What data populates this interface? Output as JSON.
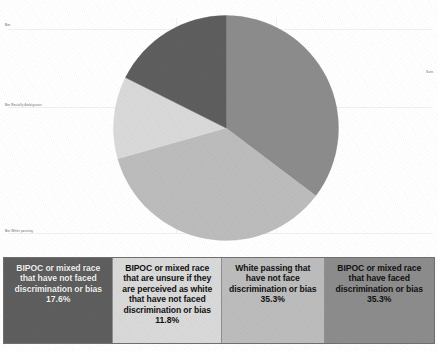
{
  "chart_data": {
    "type": "pie",
    "title": "",
    "subtitle": "",
    "xlabel": "",
    "ylabel": "",
    "grid": false,
    "legend_position": "bottom",
    "categories": [
      "BIPOC or mixed race that have not faced discrimination or bias",
      "BIPOC or mixed race that are unsure if they are perceived as white that have not faced discrimination or bias",
      "White passing that have not face discrimination or bias",
      "BIPOC or mixed race that have faced discrimination or bias"
    ],
    "values": [
      17.6,
      11.8,
      35.3,
      35.3
    ],
    "value_labels": [
      "17.6%",
      "11.8%",
      "35.3%",
      "35.3%"
    ],
    "units": "percent",
    "slice_colors": [
      "#5e5e5e",
      "#d9d9d9",
      "#bcbcbc",
      "#8c8c8c"
    ],
    "slices": [
      {
        "label": "BIPOC or mixed race that have faced discrimination or bias",
        "value": 35.3,
        "value_label": "35.3%",
        "color": "#8c8c8c",
        "start_angle": 0,
        "sweep_angle": 127.08
      },
      {
        "label": "White passing that have not face discrimination or bias",
        "value": 35.3,
        "value_label": "35.3%",
        "color": "#bcbcbc",
        "start_angle": 127.08,
        "sweep_angle": 127.08
      },
      {
        "label": "BIPOC or mixed race that are unsure if they are perceived as white that have not faced discrimination or bias",
        "value": 11.8,
        "value_label": "11.8%",
        "color": "#d9d9d9",
        "start_angle": 254.16,
        "sweep_angle": 42.48
      },
      {
        "label": "BIPOC or mixed race that have not faced discrimination or bias",
        "value": 17.6,
        "value_label": "17.6%",
        "color": "#5e5e5e",
        "start_angle": 296.64,
        "sweep_angle": 63.36
      }
    ]
  },
  "legend": {
    "cells": [
      {
        "text": "BIPOC or mixed race that have not faced discrimination or bias",
        "value": "17.6%",
        "color": "#5e5e5e",
        "theme": "dark"
      },
      {
        "text": "BIPOC or mixed race that are unsure if they are perceived as white that have not faced discrimination or bias",
        "value": "11.8%",
        "color": "#d9d9d9",
        "theme": "light"
      },
      {
        "text": "White passing that have not face discrimination or bias",
        "value": "35.3%",
        "color": "#bcbcbc",
        "theme": "light"
      },
      {
        "text": "BIPOC or mixed race that have faced discrimination or bias",
        "value": "35.3%",
        "color": "#8c8c8c",
        "theme": "light"
      }
    ]
  },
  "micro_labels": {
    "top_left": "Bar",
    "mid_left": "Bar Racially Ambiguous",
    "bottom_left": "Bar White passing",
    "top_right": "Sum"
  }
}
